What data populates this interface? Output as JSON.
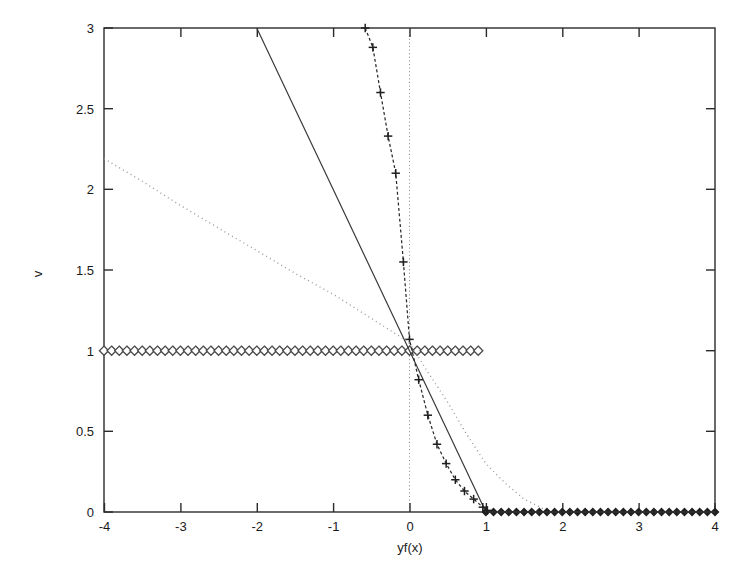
{
  "figure": {
    "background_color": "#ffffff",
    "frame_color": "#2b2b2b",
    "plot_area": {
      "left": 104,
      "top": 28,
      "right": 715,
      "bottom": 512
    }
  },
  "axis": {
    "x_title": "yf(x)",
    "y_title": "v",
    "x_ticks": [
      "-4",
      "-3",
      "-2",
      "-1",
      "0",
      "1",
      "2",
      "3",
      "4"
    ],
    "y_ticks": [
      "0",
      "0.5",
      "1",
      "1.5",
      "2",
      "2.5",
      "3"
    ]
  },
  "chart_data": {
    "type": "line",
    "title": "",
    "subtitle": "",
    "xlabel": "yf(x)",
    "ylabel": "v",
    "xlim": [
      -4,
      4
    ],
    "ylim": [
      0,
      3
    ],
    "xticks": [
      -4,
      -3,
      -2,
      -1,
      0,
      1,
      2,
      3,
      4
    ],
    "yticks": [
      0,
      0.5,
      1,
      1.5,
      2,
      2.5,
      3
    ],
    "grid": false,
    "vertical_reference_line": {
      "x": 0,
      "style": "dotted",
      "color": "#8a8a8a"
    },
    "legend": {
      "present": false,
      "position": "none"
    },
    "annotations": [],
    "series": [
      {
        "name": "misclassification-loss-0-1",
        "style": "markers-only",
        "marker": "diamond",
        "color": "#4a4a4a",
        "x": [
          -4,
          -3.9,
          -3.8,
          -3.7,
          -3.6,
          -3.5,
          -3.4,
          -3.3,
          -3.2,
          -3.1,
          -3,
          -2.9,
          -2.8,
          -2.7,
          -2.6,
          -2.5,
          -2.4,
          -2.3,
          -2.2,
          -2.1,
          -2,
          -1.9,
          -1.8,
          -1.7,
          -1.6,
          -1.5,
          -1.4,
          -1.3,
          -1.2,
          -1.1,
          -1,
          -0.9,
          -0.8,
          -0.7,
          -0.6,
          -0.5,
          -0.4,
          -0.3,
          -0.2,
          -0.1,
          0,
          0.1,
          0.2,
          0.3,
          0.4,
          0.5,
          0.6,
          0.7,
          0.8,
          0.9,
          1,
          1.1,
          1.2,
          1.3,
          1.4,
          1.5,
          1.6,
          1.7,
          1.8,
          1.9,
          2,
          2.1,
          2.2,
          2.3,
          2.4,
          2.5,
          2.6,
          2.7,
          2.8,
          2.9,
          3,
          3.1,
          3.2,
          3.3,
          3.4,
          3.5,
          3.6,
          3.7,
          3.8,
          3.9,
          4
        ],
        "y": [
          1,
          1,
          1,
          1,
          1,
          1,
          1,
          1,
          1,
          1,
          1,
          1,
          1,
          1,
          1,
          1,
          1,
          1,
          1,
          1,
          1,
          1,
          1,
          1,
          1,
          1,
          1,
          1,
          1,
          1,
          1,
          1,
          1,
          1,
          1,
          1,
          1,
          1,
          1,
          1,
          1,
          1,
          1,
          1,
          1,
          1,
          1,
          1,
          1,
          1,
          0,
          0,
          0,
          0,
          0,
          0,
          0,
          0,
          0,
          0,
          0,
          0,
          0,
          0,
          0,
          0,
          0,
          0,
          0,
          0,
          0,
          0,
          0,
          0,
          0,
          0,
          0,
          0,
          0,
          0,
          0
        ]
      },
      {
        "name": "hinge-loss",
        "style": "solid-line",
        "marker": "none",
        "color": "#3a3a3a",
        "x": [
          -2,
          -1.5,
          -1,
          -0.5,
          0,
          0.5,
          1,
          1.5,
          2,
          2.5,
          3,
          3.5,
          4
        ],
        "y": [
          3,
          2.5,
          2,
          1.5,
          1,
          0.5,
          0,
          0,
          0,
          0,
          0,
          0,
          0
        ]
      },
      {
        "name": "exponential-loss",
        "style": "dashed-line-with-plus-markers",
        "marker": "plus",
        "color": "#2b2b2b",
        "x": [
          -0.58,
          -0.48,
          -0.38,
          -0.28,
          -0.18,
          -0.08,
          0,
          0.12,
          0.24,
          0.36,
          0.48,
          0.6,
          0.72,
          0.84,
          0.96,
          1.02
        ],
        "y": [
          3,
          2.88,
          2.6,
          2.33,
          2.1,
          1.55,
          1.07,
          0.82,
          0.6,
          0.42,
          0.3,
          0.2,
          0.13,
          0.08,
          0.03,
          0.01
        ]
      },
      {
        "name": "logistic-loss",
        "style": "dotted-line",
        "marker": "none",
        "color": "#9a9a9a",
        "x": [
          -4,
          -3.5,
          -3,
          -2.5,
          -2,
          -1.5,
          -1,
          -0.5,
          0,
          0.25,
          0.5,
          0.75,
          1,
          1.25,
          1.5,
          1.75
        ],
        "y": [
          2.19,
          2.05,
          1.9,
          1.76,
          1.62,
          1.48,
          1.35,
          1.2,
          1.05,
          0.86,
          0.68,
          0.48,
          0.3,
          0.18,
          0.08,
          0.02
        ]
      }
    ]
  }
}
